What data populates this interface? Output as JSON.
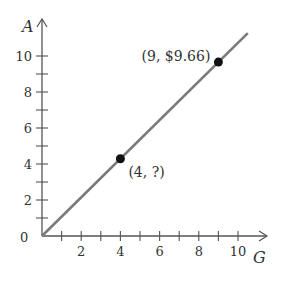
{
  "chart_data": {
    "type": "line",
    "title": "",
    "xlabel": "G",
    "ylabel": "A",
    "xlim": [
      0,
      10
    ],
    "ylim": [
      0,
      10
    ],
    "grid": false,
    "x_ticks_labeled": [
      2,
      4,
      6,
      8,
      10
    ],
    "x_ticks_minor": [
      1,
      3,
      5,
      7,
      9
    ],
    "y_ticks_labeled": [
      0,
      2,
      4,
      6,
      8,
      10
    ],
    "y_ticks_minor": [
      1,
      3,
      5,
      7,
      9
    ],
    "origin_label": "0",
    "series": [
      {
        "name": "A vs G",
        "x": [
          0,
          10.5
        ],
        "y": [
          0,
          11.27
        ],
        "color": "#7a7a7a"
      }
    ],
    "points": [
      {
        "x": 4,
        "y": 4.29,
        "label": "(4, ?)"
      },
      {
        "x": 9,
        "y": 9.66,
        "label": "(9, $9.66)"
      }
    ],
    "colors": {
      "axis": "#555555",
      "line": "#7a7a7a",
      "point": "#111111",
      "text": "#333333"
    }
  }
}
